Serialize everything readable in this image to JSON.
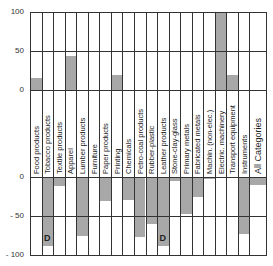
{
  "chart_data": {
    "type": "bar",
    "title": "",
    "xlabel": "",
    "ylabel": "",
    "layout": "two stacked panels: upper 0..100, lower -100..0, category labels between panels",
    "grid": true,
    "categories": [
      "Food products",
      "Tobacco products",
      "Textile products",
      "Apparel",
      "Lumber products",
      "Furniture",
      "Paper products",
      "Printing",
      "Chemicals",
      "Petro-coal products",
      "Rubber-plastic",
      "Leather products",
      "Stone-clay-glass",
      "Primary metals",
      "Fabricated metals",
      "Machin. (non-elec.)",
      "Electric. machinery",
      "Transport equipment",
      "Instruments",
      "All Categories"
    ],
    "series": [
      {
        "name": "upper panel (positive)",
        "ylim": [
          0,
          100
        ],
        "values": [
          15,
          0,
          0,
          43,
          0,
          0,
          0,
          19,
          0,
          0,
          0,
          0,
          0,
          0,
          0,
          0,
          100,
          19,
          0,
          0
        ]
      },
      {
        "name": "lower panel (negative)",
        "ylim": [
          -100,
          0
        ],
        "values": [
          0,
          -88,
          -12,
          0,
          -76,
          0,
          -31,
          0,
          -29,
          -77,
          -60,
          -88,
          -5,
          -47,
          -25,
          -3,
          0,
          0,
          -73,
          -10
        ]
      }
    ],
    "annotations": [
      {
        "category": "Tobacco products",
        "text": "D"
      },
      {
        "category": "Leather products",
        "text": "D"
      }
    ],
    "upper_ticks": [
      "100",
      "50",
      "0"
    ],
    "lower_ticks": [
      "0",
      "- 50",
      "- 100"
    ]
  },
  "annotation_label": "D"
}
